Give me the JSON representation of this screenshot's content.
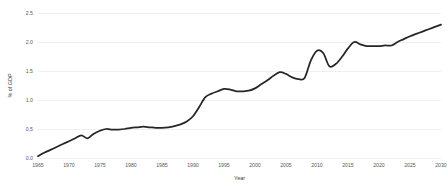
{
  "chart_data": {
    "type": "line",
    "title": "",
    "xlabel": "Year",
    "ylabel": "% of GDP",
    "xlim": [
      1965,
      2030
    ],
    "ylim": [
      0.0,
      2.5
    ],
    "grid": "horizontal",
    "legend": "none",
    "line_color": "#262626",
    "gridline_color": "#e6e6e6",
    "background_color": "#ffffff",
    "xticks": [
      1965,
      1970,
      1975,
      1980,
      1985,
      1990,
      1995,
      2000,
      2005,
      2010,
      2015,
      2020,
      2025,
      2030
    ],
    "xtick_labels": [
      "1965",
      "1970",
      "1975",
      "1980",
      "1985",
      "1990",
      "1995",
      "2000",
      "2005",
      "2010",
      "2015",
      "2020",
      "2025",
      "2030"
    ],
    "yticks": [
      0.0,
      0.5,
      1.0,
      1.5,
      2.0,
      2.5
    ],
    "ytick_labels": [
      "0.0",
      "0.5",
      "1.0",
      "1.5",
      "2.0",
      "2.5"
    ],
    "series": [
      {
        "name": "R&D expenditure",
        "x": [
          1965,
          1966,
          1967,
          1968,
          1969,
          1970,
          1971,
          1972,
          1973,
          1974,
          1975,
          1976,
          1977,
          1978,
          1979,
          1980,
          1981,
          1982,
          1983,
          1984,
          1985,
          1986,
          1987,
          1988,
          1989,
          1990,
          1991,
          1992,
          1993,
          1994,
          1995,
          1996,
          1997,
          1998,
          1999,
          2000,
          2001,
          2002,
          2003,
          2004,
          2005,
          2006,
          2007,
          2008,
          2009,
          2010,
          2011,
          2012,
          2013,
          2014,
          2015,
          2016,
          2017,
          2018,
          2019,
          2020,
          2021,
          2022,
          2023,
          2024,
          2025,
          2026,
          2027,
          2028,
          2029,
          2030
        ],
        "values": [
          0.03,
          0.09,
          0.14,
          0.19,
          0.24,
          0.29,
          0.34,
          0.39,
          0.34,
          0.42,
          0.47,
          0.5,
          0.49,
          0.49,
          0.5,
          0.52,
          0.53,
          0.54,
          0.53,
          0.52,
          0.52,
          0.53,
          0.55,
          0.58,
          0.63,
          0.72,
          0.88,
          1.05,
          1.11,
          1.15,
          1.19,
          1.18,
          1.15,
          1.15,
          1.16,
          1.2,
          1.27,
          1.34,
          1.42,
          1.48,
          1.45,
          1.39,
          1.36,
          1.38,
          1.68,
          1.85,
          1.81,
          1.58,
          1.62,
          1.74,
          1.89,
          2.0,
          1.96,
          1.93,
          1.93,
          1.93,
          1.94,
          1.94,
          2.0,
          2.05,
          2.1,
          2.14,
          2.18,
          2.22,
          2.26,
          2.3
        ]
      }
    ]
  }
}
